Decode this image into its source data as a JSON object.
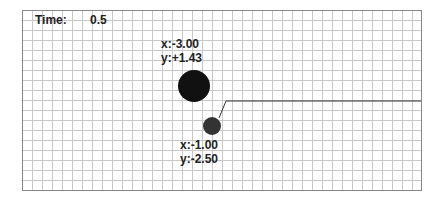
{
  "time": {
    "label": "Time:",
    "value": "0.5"
  },
  "grid": {
    "x0": 22,
    "y0": 10,
    "x1": 421,
    "y1": 190,
    "step": 10,
    "line_color": "#c8c8c8",
    "border_color": "#888888"
  },
  "bodies": [
    {
      "name": "large",
      "cx": 194,
      "cy": 86,
      "r": 16,
      "color": "#111111",
      "label_x": "x:-3.00",
      "label_y": "y:+1.43",
      "lx": 161,
      "ly": 37
    },
    {
      "name": "small",
      "cx": 212,
      "cy": 126,
      "r": 9,
      "color": "#333333",
      "label_x": "x:-1.00",
      "label_y": "y:-2.50",
      "lx": 180,
      "ly": 138
    }
  ],
  "trace": {
    "points": [
      [
        219,
        118
      ],
      [
        226,
        101
      ],
      [
        421,
        101
      ]
    ],
    "color": "#333333"
  }
}
